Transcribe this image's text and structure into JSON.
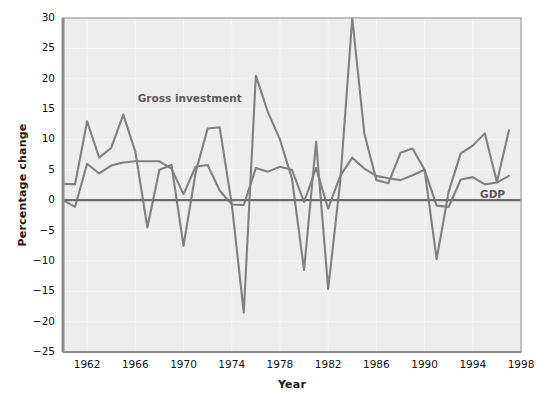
{
  "figure": {
    "background_color": "#ffffff",
    "plot_background_color": "#ededed",
    "frame_color": "#9a9a9a",
    "gridline_color": "#f7f7f7",
    "line_color": "#808080",
    "zero_line_color": "#6e6e6e"
  },
  "labels": {
    "ylabel": "Percentage change",
    "xlabel": "Year"
  },
  "annotations": {
    "gross_investment": "Gross investment",
    "gdp": "GDP"
  },
  "chart_data": {
    "type": "line",
    "title": "",
    "xlabel": "Year",
    "ylabel": "Percentage change",
    "xlim": [
      1960,
      1998
    ],
    "ylim": [
      -25,
      30
    ],
    "yticks": [
      -25,
      -20,
      -15,
      -10,
      -5,
      0,
      5,
      10,
      15,
      20,
      25,
      30
    ],
    "xticks": [
      1962,
      1966,
      1970,
      1974,
      1978,
      1982,
      1986,
      1990,
      1994,
      1998
    ],
    "grid": true,
    "legend_position": "inline-annotation",
    "x": [
      1960,
      1961,
      1962,
      1963,
      1964,
      1965,
      1966,
      1967,
      1968,
      1969,
      1970,
      1971,
      1972,
      1973,
      1974,
      1975,
      1976,
      1977,
      1978,
      1979,
      1980,
      1981,
      1982,
      1983,
      1984,
      1985,
      1986,
      1987,
      1988,
      1989,
      1990,
      1991,
      1992,
      1993,
      1994,
      1995,
      1996,
      1997
    ],
    "series": [
      {
        "name": "Gross investment",
        "values": [
          2.7,
          2.6,
          13.0,
          7.0,
          8.6,
          14.1,
          8.0,
          -4.5,
          5.0,
          5.8,
          -7.5,
          4.5,
          11.8,
          12.0,
          -0.6,
          -18.5,
          20.5,
          14.5,
          10.0,
          3.5,
          -11.5,
          9.6,
          -14.6,
          3.0,
          30.0,
          11.0,
          3.3,
          2.8,
          7.8,
          8.5,
          5.0,
          -9.7,
          1.4,
          7.7,
          9.0,
          11.0,
          3.0,
          11.5
        ]
      },
      {
        "name": "GDP",
        "values": [
          0.0,
          -1.1,
          6.0,
          4.4,
          5.7,
          6.2,
          6.4,
          6.4,
          6.4,
          5.2,
          1.0,
          5.5,
          5.8,
          1.6,
          -0.7,
          -0.8,
          5.3,
          4.7,
          5.5,
          5.0,
          -0.3,
          5.3,
          -1.4,
          4.0,
          7.0,
          5.2,
          4.0,
          3.6,
          3.3,
          4.1,
          5.0,
          -0.9,
          -1.1,
          3.4,
          3.8,
          2.6,
          2.9,
          4.0
        ]
      }
    ]
  }
}
